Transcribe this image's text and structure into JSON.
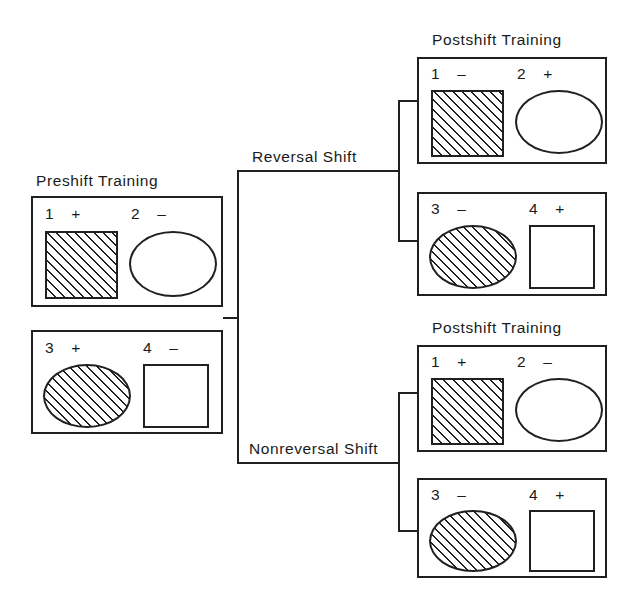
{
  "figure": {
    "title_preshift": "Preshift Training",
    "title_postshift_top": "Postshift Training",
    "title_postshift_bottom": "Postshift Training",
    "branch_top_label": "Reversal Shift",
    "branch_bottom_label": "Nonreversal Shift",
    "ink_color": "#202020",
    "background_color": "#ffffff"
  },
  "preshift": {
    "heading": "Preshift Training",
    "panels": [
      {
        "panel_name": "preshift-panel-1",
        "stimuli": [
          {
            "number": "1",
            "sign": "+",
            "shape": "square",
            "fill": "hatched"
          },
          {
            "number": "2",
            "sign": "–",
            "shape": "ellipse",
            "fill": "empty"
          }
        ]
      },
      {
        "panel_name": "preshift-panel-2",
        "stimuli": [
          {
            "number": "3",
            "sign": "+",
            "shape": "ellipse",
            "fill": "hatched"
          },
          {
            "number": "4",
            "sign": "–",
            "shape": "square",
            "fill": "empty"
          }
        ]
      }
    ]
  },
  "reversal_shift": {
    "branch_label": "Reversal Shift",
    "heading": "Postshift Training",
    "panels": [
      {
        "panel_name": "reversal-panel-1",
        "stimuli": [
          {
            "number": "1",
            "sign": "–",
            "shape": "square",
            "fill": "hatched"
          },
          {
            "number": "2",
            "sign": "+",
            "shape": "ellipse",
            "fill": "empty"
          }
        ]
      },
      {
        "panel_name": "reversal-panel-2",
        "stimuli": [
          {
            "number": "3",
            "sign": "–",
            "shape": "ellipse",
            "fill": "hatched"
          },
          {
            "number": "4",
            "sign": "+",
            "shape": "square",
            "fill": "empty"
          }
        ]
      }
    ]
  },
  "nonreversal_shift": {
    "branch_label": "Nonreversal Shift",
    "heading": "Postshift Training",
    "panels": [
      {
        "panel_name": "nonreversal-panel-1",
        "stimuli": [
          {
            "number": "1",
            "sign": "+",
            "shape": "square",
            "fill": "hatched"
          },
          {
            "number": "2",
            "sign": "–",
            "shape": "ellipse",
            "fill": "empty"
          }
        ]
      },
      {
        "panel_name": "nonreversal-panel-2",
        "stimuli": [
          {
            "number": "3",
            "sign": "–",
            "shape": "ellipse",
            "fill": "hatched"
          },
          {
            "number": "4",
            "sign": "+",
            "shape": "square",
            "fill": "empty"
          }
        ]
      }
    ]
  }
}
